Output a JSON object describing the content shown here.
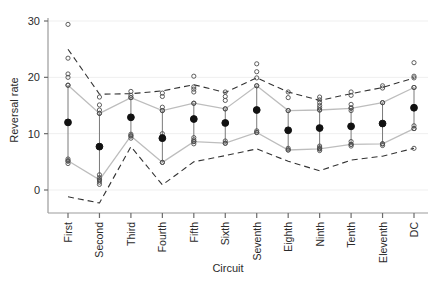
{
  "chart_data": {
    "type": "scatter",
    "title": "",
    "xlabel": "Circuit",
    "ylabel": "Reversal rate",
    "categories": [
      "First",
      "Second",
      "Third",
      "Fourth",
      "Fifth",
      "Sixth",
      "Seventh",
      "Eighth",
      "Ninth",
      "Tenth",
      "Eleventh",
      "DC"
    ],
    "ylim": [
      -4,
      31
    ],
    "yticks": [
      0,
      10,
      20,
      30
    ],
    "xlim": [
      0.5,
      12.5
    ],
    "grid": false,
    "legend": null,
    "series": [
      {
        "name": "Mean reversal rate",
        "marker": "filled-circle",
        "color": "#000000",
        "values": [
          12.0,
          7.7,
          12.9,
          9.2,
          12.6,
          11.9,
          14.2,
          10.6,
          11.0,
          11.3,
          11.8,
          14.6
        ]
      },
      {
        "name": "Error bar upper (95% CI)",
        "marker": "open-circle",
        "color": "#555555",
        "values": [
          18.6,
          13.6,
          16.4,
          14.1,
          15.4,
          14.4,
          18.5,
          14.1,
          14.2,
          14.5,
          15.5,
          18.2
        ]
      },
      {
        "name": "Error bar lower (95% CI)",
        "marker": "open-circle",
        "color": "#555555",
        "values": [
          5.2,
          1.8,
          9.6,
          4.9,
          8.6,
          8.3,
          10.2,
          7.1,
          7.3,
          8.1,
          8.2,
          10.9
        ]
      },
      {
        "name": "Upper prediction band",
        "marker": "dashed-line",
        "color": "#333333",
        "values": [
          25.0,
          17.0,
          17.1,
          17.6,
          18.7,
          17.3,
          19.9,
          17.4,
          15.9,
          17.1,
          18.2,
          19.9
        ]
      },
      {
        "name": "Lower prediction band",
        "marker": "dashed-line",
        "color": "#333333",
        "values": [
          -1.2,
          -2.3,
          7.7,
          0.9,
          5.0,
          6.1,
          7.3,
          5.1,
          3.4,
          5.3,
          6.0,
          7.4
        ]
      }
    ],
    "observations": [
      {
        "circuit": "First",
        "values": [
          29.4,
          23.4,
          20.6,
          20.0,
          18.6,
          5.5,
          5.1,
          4.7
        ]
      },
      {
        "circuit": "Second",
        "values": [
          16.5,
          15.1,
          14.2,
          13.6,
          2.7,
          2.2,
          1.8,
          1.4,
          1.0
        ]
      },
      {
        "circuit": "Third",
        "values": [
          17.5,
          16.8,
          16.4,
          9.9,
          9.6,
          9.2
        ]
      },
      {
        "circuit": "Fourth",
        "values": [
          17.2,
          16.6,
          14.7,
          14.1,
          10.0,
          9.5,
          9.1,
          4.9
        ]
      },
      {
        "circuit": "Fifth",
        "values": [
          20.2,
          18.3,
          17.9,
          17.4,
          15.4,
          9.3,
          8.9,
          8.6,
          8.2
        ]
      },
      {
        "circuit": "Sixth",
        "values": [
          17.4,
          16.6,
          15.9,
          14.4,
          8.7,
          8.3
        ]
      },
      {
        "circuit": "Seventh",
        "values": [
          22.4,
          21.0,
          19.9,
          18.5,
          10.5,
          10.2
        ]
      },
      {
        "circuit": "Eighth",
        "values": [
          17.4,
          16.4,
          14.1,
          7.4,
          7.1
        ]
      },
      {
        "circuit": "Ninth",
        "values": [
          16.5,
          16.0,
          15.5,
          15.0,
          14.6,
          14.2,
          7.8,
          7.5,
          7.3,
          7.0
        ]
      },
      {
        "circuit": "Tenth",
        "values": [
          17.4,
          16.8,
          15.2,
          14.6,
          14.1,
          8.6,
          8.1,
          7.8
        ]
      },
      {
        "circuit": "Eleventh",
        "values": [
          18.5,
          18.1,
          15.5,
          8.2,
          7.9
        ]
      },
      {
        "circuit": "DC",
        "values": [
          22.6,
          20.2,
          19.9,
          18.2,
          11.4,
          10.9,
          7.4
        ]
      }
    ]
  }
}
